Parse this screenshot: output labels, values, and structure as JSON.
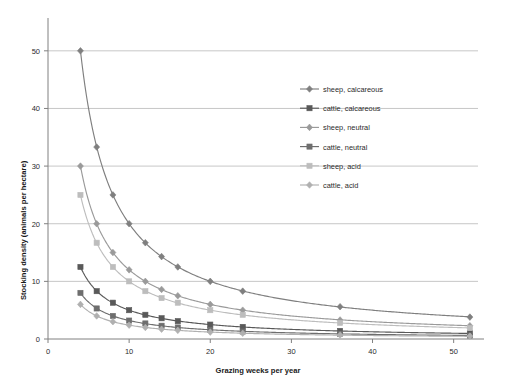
{
  "chart_data": {
    "type": "line",
    "title": "",
    "xlabel": "Grazing weeks per year",
    "ylabel": "Stocking density (animals per hectare)",
    "xlim": [
      0,
      53
    ],
    "ylim": [
      0,
      55
    ],
    "xticks": [
      0,
      10,
      20,
      30,
      40,
      50
    ],
    "yticks": [
      0,
      10,
      20,
      30,
      40,
      50
    ],
    "grid": "horizontal",
    "legend_position": "right-inside",
    "x": [
      4,
      6,
      8,
      10,
      12,
      14,
      16,
      20,
      24,
      36,
      52
    ],
    "series": [
      {
        "name": "sheep, calcareous",
        "marker": "diamond",
        "color": "#7f7f7f",
        "values": [
          50,
          33.3,
          25,
          20,
          16.7,
          14.3,
          12.5,
          10,
          8.3,
          5.6,
          3.8
        ]
      },
      {
        "name": "cattle, calcareous",
        "marker": "square",
        "color": "#595959",
        "values": [
          12.5,
          8.3,
          6.3,
          5,
          4.2,
          3.6,
          3.1,
          2.5,
          2.1,
          1.4,
          1.0
        ]
      },
      {
        "name": "sheep, neutral",
        "marker": "diamond",
        "color": "#9a9a9a",
        "values": [
          30,
          20,
          15,
          12,
          10,
          8.6,
          7.5,
          6,
          5,
          3.3,
          2.3
        ]
      },
      {
        "name": "cattle, neutral",
        "marker": "square",
        "color": "#6e6e6e",
        "values": [
          8,
          5.3,
          4,
          3.2,
          2.7,
          2.3,
          2.0,
          1.6,
          1.3,
          0.9,
          0.6
        ]
      },
      {
        "name": "sheep, acid",
        "marker": "square",
        "color": "#bdbdbd",
        "values": [
          25,
          16.7,
          12.5,
          10,
          8.3,
          7.1,
          6.3,
          5,
          4.2,
          2.8,
          1.9
        ]
      },
      {
        "name": "cattle, acid",
        "marker": "diamond",
        "color": "#b0b0b0",
        "values": [
          6,
          4,
          3,
          2.4,
          2,
          1.7,
          1.5,
          1.2,
          1.0,
          0.7,
          0.5
        ]
      }
    ]
  },
  "axes": {
    "y_title": "Stocking density (animals per hectare)",
    "x_title": "Grazing weeks per year",
    "y_tick_labels": [
      "0",
      "10",
      "20",
      "30",
      "40",
      "50"
    ],
    "x_tick_labels": [
      "0",
      "10",
      "20",
      "30",
      "40",
      "50"
    ]
  },
  "legend": {
    "items": [
      {
        "label": "sheep, calcareous"
      },
      {
        "label": "cattle, calcareous"
      },
      {
        "label": "sheep, neutral"
      },
      {
        "label": "cattle, neutral"
      },
      {
        "label": "sheep, acid"
      },
      {
        "label": "cattle, acid"
      }
    ]
  }
}
